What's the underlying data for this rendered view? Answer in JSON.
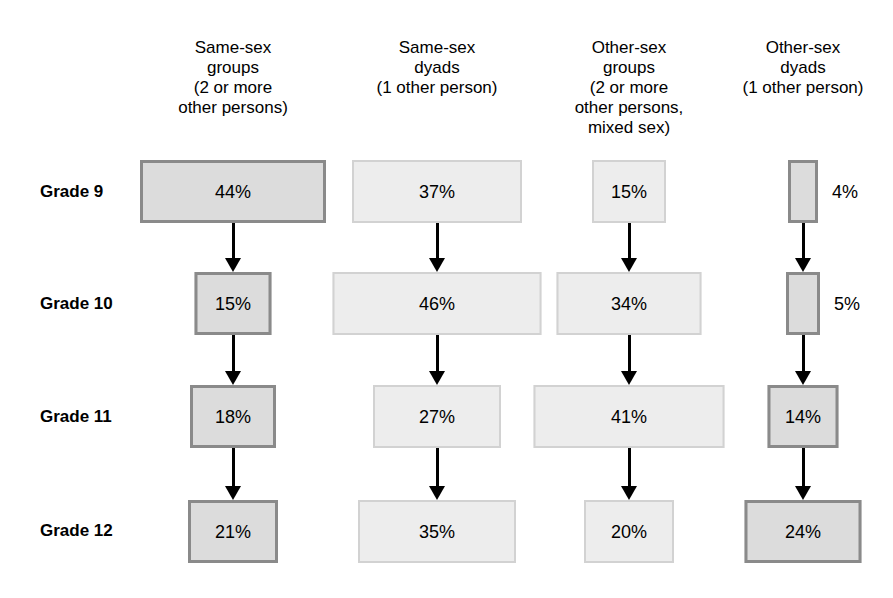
{
  "chart_data": {
    "type": "diagram",
    "title": "",
    "diagram_kind": "flow-chart of transition percentages by grade and companionship type",
    "row_label_header": "",
    "columns": [
      {
        "id": "same-sex-groups",
        "label": "Same-sex\ngroups\n(2 or more\nother persons)",
        "style": "dark",
        "center_x": 233
      },
      {
        "id": "same-sex-dyads",
        "label": "Same-sex\ndyads\n(1 other person)",
        "style": "light",
        "center_x": 437
      },
      {
        "id": "other-sex-groups",
        "label": "Other-sex\ngroups\n(2 or more\nother persons,\nmixed sex)",
        "style": "light",
        "center_x": 629
      },
      {
        "id": "other-sex-dyads",
        "label": "Other-sex\ndyads\n(1 other person)",
        "style": "dark",
        "center_x": 803
      }
    ],
    "rows": [
      {
        "id": "grade-9",
        "label": "Grade 9",
        "center_y": 192
      },
      {
        "id": "grade-10",
        "label": "Grade 10",
        "center_y": 304
      },
      {
        "id": "grade-11",
        "label": "Grade 11",
        "center_y": 417
      },
      {
        "id": "grade-12",
        "label": "Grade 12",
        "center_y": 531
      }
    ],
    "categories": [
      "Grade 9",
      "Grade 10",
      "Grade 11",
      "Grade 12"
    ],
    "series": [
      {
        "name": "Same-sex groups (2 or more other persons)",
        "values": [
          44,
          15,
          18,
          21
        ]
      },
      {
        "name": "Same-sex dyads (1 other person)",
        "values": [
          37,
          46,
          27,
          35
        ]
      },
      {
        "name": "Other-sex groups (2 or more other persons, mixed sex)",
        "values": [
          15,
          34,
          41,
          20
        ]
      },
      {
        "name": "Other-sex dyads (1 other person)",
        "values": [
          4,
          5,
          14,
          24
        ]
      }
    ],
    "cells": [
      {
        "id": "c1r1",
        "column": "same-sex-groups",
        "row": "grade-9",
        "value": 44,
        "label": "44%",
        "style": "dark",
        "label_position": "inside",
        "x": 233,
        "y": 160,
        "w": 186,
        "h": 63
      },
      {
        "id": "c1r2",
        "column": "same-sex-groups",
        "row": "grade-10",
        "value": 15,
        "label": "15%",
        "style": "dark",
        "label_position": "inside",
        "x": 233,
        "y": 272,
        "w": 77,
        "h": 63
      },
      {
        "id": "c1r3",
        "column": "same-sex-groups",
        "row": "grade-11",
        "value": 18,
        "label": "18%",
        "style": "dark",
        "label_position": "inside",
        "x": 233,
        "y": 385,
        "w": 86,
        "h": 63
      },
      {
        "id": "c1r4",
        "column": "same-sex-groups",
        "row": "grade-12",
        "value": 21,
        "label": "21%",
        "style": "dark",
        "label_position": "inside",
        "x": 233,
        "y": 500,
        "w": 90,
        "h": 63
      },
      {
        "id": "c2r1",
        "column": "same-sex-dyads",
        "row": "grade-9",
        "value": 37,
        "label": "37%",
        "style": "light",
        "label_position": "inside",
        "x": 437,
        "y": 160,
        "w": 170,
        "h": 63
      },
      {
        "id": "c2r2",
        "column": "same-sex-dyads",
        "row": "grade-10",
        "value": 46,
        "label": "46%",
        "style": "light",
        "label_position": "inside",
        "x": 437,
        "y": 272,
        "w": 209,
        "h": 63
      },
      {
        "id": "c2r3",
        "column": "same-sex-dyads",
        "row": "grade-11",
        "value": 27,
        "label": "27%",
        "style": "light",
        "label_position": "inside",
        "x": 437,
        "y": 385,
        "w": 128,
        "h": 63
      },
      {
        "id": "c2r4",
        "column": "same-sex-dyads",
        "row": "grade-12",
        "value": 35,
        "label": "35%",
        "style": "light",
        "label_position": "inside",
        "x": 437,
        "y": 500,
        "w": 158,
        "h": 63
      },
      {
        "id": "c3r1",
        "column": "other-sex-groups",
        "row": "grade-9",
        "value": 15,
        "label": "15%",
        "style": "light",
        "label_position": "inside",
        "x": 629,
        "y": 160,
        "w": 74,
        "h": 63
      },
      {
        "id": "c3r2",
        "column": "other-sex-groups",
        "row": "grade-10",
        "value": 34,
        "label": "34%",
        "style": "light",
        "label_position": "inside",
        "x": 629,
        "y": 272,
        "w": 145,
        "h": 63
      },
      {
        "id": "c3r3",
        "column": "other-sex-groups",
        "row": "grade-11",
        "value": 41,
        "label": "41%",
        "style": "light",
        "label_position": "inside",
        "x": 629,
        "y": 385,
        "w": 191,
        "h": 63
      },
      {
        "id": "c3r4",
        "column": "other-sex-groups",
        "row": "grade-12",
        "value": 20,
        "label": "20%",
        "style": "light",
        "label_position": "inside",
        "x": 629,
        "y": 500,
        "w": 90,
        "h": 63
      },
      {
        "id": "c4r1",
        "column": "other-sex-dyads",
        "row": "grade-9",
        "value": 4,
        "label": "4%",
        "style": "dark",
        "label_position": "outside-right",
        "x": 803,
        "y": 160,
        "w": 30,
        "h": 63
      },
      {
        "id": "c4r2",
        "column": "other-sex-dyads",
        "row": "grade-10",
        "value": 5,
        "label": "5%",
        "style": "dark",
        "label_position": "outside-right",
        "x": 803,
        "y": 272,
        "w": 34,
        "h": 63
      },
      {
        "id": "c4r3",
        "column": "other-sex-dyads",
        "row": "grade-11",
        "value": 14,
        "label": "14%",
        "style": "dark",
        "label_position": "inside",
        "x": 803,
        "y": 385,
        "w": 71,
        "h": 63
      },
      {
        "id": "c4r4",
        "column": "other-sex-dyads",
        "row": "grade-12",
        "value": 24,
        "label": "24%",
        "style": "dark",
        "label_position": "inside",
        "x": 803,
        "y": 500,
        "w": 117,
        "h": 63
      }
    ],
    "arrows": [
      {
        "id": "a1r1",
        "column": "same-sex-groups",
        "from": "grade-9",
        "to": "grade-10",
        "x": 233,
        "y": 223,
        "h": 49
      },
      {
        "id": "a1r2",
        "column": "same-sex-groups",
        "from": "grade-10",
        "to": "grade-11",
        "x": 233,
        "y": 335,
        "h": 50
      },
      {
        "id": "a1r3",
        "column": "same-sex-groups",
        "from": "grade-11",
        "to": "grade-12",
        "x": 233,
        "y": 448,
        "h": 52
      },
      {
        "id": "a2r1",
        "column": "same-sex-dyads",
        "from": "grade-9",
        "to": "grade-10",
        "x": 437,
        "y": 223,
        "h": 49
      },
      {
        "id": "a2r2",
        "column": "same-sex-dyads",
        "from": "grade-10",
        "to": "grade-11",
        "x": 437,
        "y": 335,
        "h": 50
      },
      {
        "id": "a2r3",
        "column": "same-sex-dyads",
        "from": "grade-11",
        "to": "grade-12",
        "x": 437,
        "y": 448,
        "h": 52
      },
      {
        "id": "a3r1",
        "column": "other-sex-groups",
        "from": "grade-9",
        "to": "grade-10",
        "x": 629,
        "y": 223,
        "h": 49
      },
      {
        "id": "a3r2",
        "column": "other-sex-groups",
        "from": "grade-10",
        "to": "grade-11",
        "x": 629,
        "y": 335,
        "h": 50
      },
      {
        "id": "a3r3",
        "column": "other-sex-groups",
        "from": "grade-11",
        "to": "grade-12",
        "x": 629,
        "y": 448,
        "h": 52
      },
      {
        "id": "a4r1",
        "column": "other-sex-dyads",
        "from": "grade-9",
        "to": "grade-10",
        "x": 803,
        "y": 223,
        "h": 49
      },
      {
        "id": "a4r2",
        "column": "other-sex-dyads",
        "from": "grade-10",
        "to": "grade-11",
        "x": 803,
        "y": 335,
        "h": 50
      },
      {
        "id": "a4r3",
        "column": "other-sex-dyads",
        "from": "grade-11",
        "to": "grade-12",
        "x": 803,
        "y": 448,
        "h": 52
      }
    ],
    "colors": {
      "dark_fill": "#dcdcdc",
      "dark_border": "#8a8a8a",
      "light_fill": "#ededed",
      "light_border": "#d2d2d2",
      "arrow": "#000000",
      "text": "#000000",
      "background": "#ffffff"
    },
    "row_label_x": 40,
    "header_baseline_y": 38
  }
}
